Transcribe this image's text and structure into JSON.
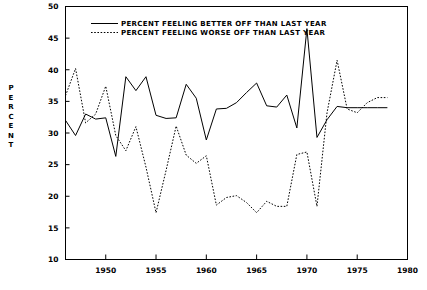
{
  "chart_data": {
    "type": "line",
    "title": "",
    "xlabel": "",
    "ylabel": "PERCENT",
    "xlim": [
      1946,
      1980
    ],
    "ylim": [
      10,
      50
    ],
    "xticks": [
      1950,
      1955,
      1960,
      1965,
      1970,
      1975,
      1980
    ],
    "yticks": [
      10,
      15,
      20,
      25,
      30,
      35,
      40,
      45,
      50
    ],
    "grid": false,
    "legend_position": "top-center",
    "x": [
      1946,
      1947,
      1948,
      1949,
      1950,
      1951,
      1952,
      1953,
      1954,
      1955,
      1956,
      1957,
      1958,
      1959,
      1960,
      1961,
      1962,
      1963,
      1964,
      1965,
      1966,
      1967,
      1968,
      1969,
      1970,
      1971,
      1972,
      1973,
      1974,
      1975,
      1976,
      1977,
      1978
    ],
    "series": [
      {
        "name": "PERCENT FEELING BETTER OFF THAN LAST YEAR",
        "style": "solid",
        "values": [
          32.0,
          29.6,
          33.0,
          32.2,
          32.4,
          26.3,
          38.9,
          36.7,
          38.9,
          32.8,
          32.3,
          32.4,
          37.7,
          35.5,
          28.9,
          33.8,
          33.9,
          34.8,
          36.4,
          37.9,
          34.3,
          34.1,
          36.0,
          30.8,
          46.5,
          29.3,
          32.1,
          34.2,
          34.0,
          34.0,
          34.0,
          34.0,
          34.0
        ]
      },
      {
        "name": "PERCENT FEELING WORSE  OFF THAN LAST YEAR",
        "style": "dotted",
        "values": [
          35.9,
          40.2,
          31.6,
          33.0,
          37.4,
          29.6,
          27.2,
          31.0,
          24.6,
          17.4,
          24.1,
          31.1,
          26.5,
          25.2,
          26.4,
          18.6,
          19.8,
          20.1,
          19.0,
          17.4,
          19.2,
          18.4,
          18.4,
          26.6,
          27.0,
          18.4,
          33.2,
          41.5,
          33.8,
          33.2,
          34.8,
          35.6,
          35.6
        ]
      }
    ],
    "series_x_overrides": {
      "better": [
        1946,
        1947,
        1948,
        1949,
        1950,
        1951,
        1952,
        1953,
        1954,
        1955,
        1956,
        1957,
        1958,
        1959,
        1960,
        1961,
        1962,
        1963,
        1964,
        1965,
        1966,
        1967,
        1968,
        1969,
        1970,
        1971,
        1972,
        1973,
        1974,
        1975,
        1976,
        1977,
        1978
      ],
      "worse": [
        1946,
        1947,
        1948,
        1949,
        1950,
        1951,
        1952,
        1953,
        1954,
        1955,
        1956,
        1957,
        1958,
        1959,
        1960,
        1961,
        1962,
        1963,
        1964,
        1965,
        1966,
        1967,
        1968,
        1969,
        1970,
        1971,
        1972,
        1973,
        1974,
        1975,
        1976,
        1977,
        1978
      ]
    }
  },
  "axis": {
    "y_title_chars": [
      "P",
      "E",
      "R",
      "C",
      "E",
      "N",
      "T"
    ],
    "y_tick_labels": [
      "50",
      "45",
      "40",
      "35",
      "30",
      "25",
      "20",
      "15",
      "10"
    ],
    "x_tick_labels": [
      "1950",
      "1955",
      "1960",
      "1965",
      "1970",
      "1975",
      "1980"
    ]
  },
  "legend": {
    "entries": [
      {
        "label": "PERCENT FEELING BETTER OFF THAN LAST YEAR",
        "style": "solid"
      },
      {
        "label": "PERCENT FEELING WORSE  OFF THAN LAST YEAR",
        "style": "dotted"
      }
    ]
  },
  "colors": {
    "line": "#000000",
    "frame": "#000000",
    "background": "#ffffff"
  }
}
